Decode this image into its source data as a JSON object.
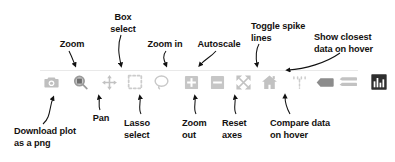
{
  "diagram": {
    "text_color": "#14110f",
    "icon_color": "#bdbdbd",
    "icon_active_color": "#3b3b3b",
    "rule_color": "#e9e9e9"
  },
  "toolbar": {
    "buttons": [
      {
        "name": "download-plot-button",
        "icon": "camera-icon",
        "x": 0,
        "state": "inactive"
      },
      {
        "name": "zoom-button",
        "icon": "magnifier-icon",
        "x": 29,
        "state": "inactive"
      },
      {
        "name": "pan-button",
        "icon": "move-arrows-icon",
        "x": 58,
        "state": "inactive"
      },
      {
        "name": "box-select-button",
        "icon": "dashed-square-icon",
        "x": 84,
        "state": "inactive"
      },
      {
        "name": "lasso-select-button",
        "icon": "lasso-icon",
        "x": 110,
        "state": "inactive"
      },
      {
        "name": "zoom-in-button",
        "icon": "plus-square-icon",
        "x": 140,
        "state": "inactive"
      },
      {
        "name": "zoom-out-button",
        "icon": "minus-square-icon",
        "x": 166,
        "state": "inactive"
      },
      {
        "name": "autoscale-button",
        "icon": "expand-arrows-icon",
        "x": 192,
        "state": "inactive"
      },
      {
        "name": "reset-axes-button",
        "icon": "home-icon",
        "x": 218,
        "state": "inactive"
      },
      {
        "name": "toggle-spike-lines-button",
        "icon": "spike-lines-icon",
        "x": 248,
        "state": "inactive"
      },
      {
        "name": "show-closest-data-button",
        "icon": "hover-closest-icon",
        "x": 274,
        "state": "inactive"
      },
      {
        "name": "compare-data-button",
        "icon": "hover-compare-icon",
        "x": 297,
        "state": "inactive"
      },
      {
        "name": "plotly-logo-button",
        "icon": "plotly-bars-icon",
        "x": 328,
        "state": "active"
      }
    ]
  },
  "annotations": {
    "above": [
      {
        "name": "annotation-zoom",
        "text": "Zoom",
        "left": 52,
        "top": 39,
        "width": 40,
        "align": "center"
      },
      {
        "name": "annotation-box-select",
        "text": "Box\nselect",
        "left": 102,
        "top": 12,
        "width": 42,
        "align": "center"
      },
      {
        "name": "annotation-zoom-in",
        "text": "Zoom in",
        "left": 141,
        "top": 39,
        "width": 48,
        "align": "center"
      },
      {
        "name": "annotation-autoscale",
        "text": "Autoscale",
        "left": 192,
        "top": 39,
        "width": 54,
        "align": "center"
      },
      {
        "name": "annotation-toggle-spike-lines",
        "text": "Toggle spike\nlines",
        "left": 251,
        "top": 21,
        "width": 62,
        "align": "left"
      },
      {
        "name": "annotation-show-closest-data",
        "text": "Show closest\ndata on hover",
        "left": 314,
        "top": 32,
        "width": 76,
        "align": "left"
      }
    ],
    "below": [
      {
        "name": "annotation-download-plot",
        "text": "Download plot\nas a png",
        "left": 14,
        "top": 126,
        "width": 86,
        "align": "left"
      },
      {
        "name": "annotation-pan",
        "text": "Pan",
        "left": 88,
        "top": 113,
        "width": 26,
        "align": "center"
      },
      {
        "name": "annotation-lasso-select",
        "text": "Lasso\nselect",
        "left": 124,
        "top": 118,
        "width": 38,
        "align": "left"
      },
      {
        "name": "annotation-zoom-out",
        "text": "Zoom\nout",
        "left": 182,
        "top": 118,
        "width": 38,
        "align": "left"
      },
      {
        "name": "annotation-reset-axes",
        "text": "Reset\naxes",
        "left": 222,
        "top": 118,
        "width": 38,
        "align": "left"
      },
      {
        "name": "annotation-compare-data",
        "text": "Compare data\non hover",
        "left": 270,
        "top": 118,
        "width": 80,
        "align": "left"
      }
    ]
  }
}
